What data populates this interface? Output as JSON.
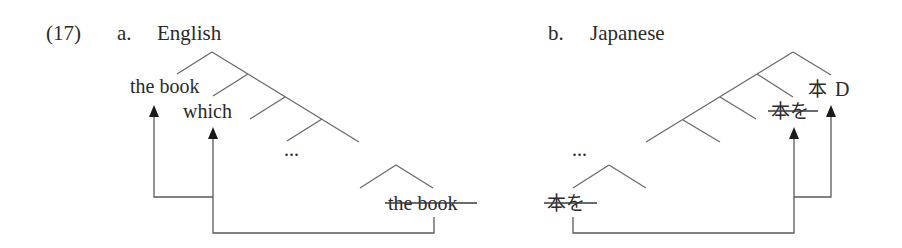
{
  "example_number": "(17)",
  "panels": [
    {
      "id": "a",
      "marker": "a.",
      "language": "English",
      "moved_phrase": "the book",
      "relative_pronoun": "which",
      "ellipsis": "...",
      "trace": "the book",
      "trace_struck": true,
      "arrows": [
        {
          "from": "trace",
          "to": "which"
        },
        {
          "from": "which-position",
          "to": "the book"
        }
      ]
    },
    {
      "id": "b",
      "marker": "b.",
      "language": "Japanese",
      "head_noun": "本",
      "determiner": "D",
      "intermediate_copy": "本を",
      "intermediate_struck": true,
      "ellipsis": "...",
      "base_copy": "本を",
      "base_struck": true,
      "arrows": [
        {
          "from": "base_copy",
          "to": "intermediate_copy"
        },
        {
          "from": "intermediate-position",
          "to": "本 D"
        }
      ]
    }
  ]
}
